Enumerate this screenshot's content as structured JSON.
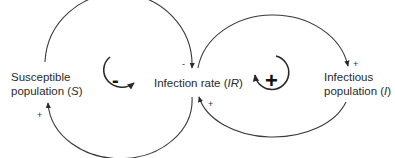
{
  "nodes": {
    "susceptible": {
      "line1": "Susceptible",
      "line2_prefix": "population (",
      "line2_var": "S",
      "line2_suffix": ")"
    },
    "infection_rate": {
      "prefix": "Infection rate (",
      "var": "IR",
      "suffix": ")"
    },
    "infectious": {
      "line1": "Infectious",
      "line2_prefix": "population (",
      "line2_var": "I",
      "line2_suffix": ")"
    }
  },
  "links": {
    "s_to_ir_polarity": "-",
    "ir_to_s_polarity": "+",
    "ir_to_i_polarity": "+",
    "i_to_ir_polarity": "+"
  },
  "loops": {
    "left": {
      "polarity": "-",
      "type": "balancing"
    },
    "right": {
      "polarity": "+",
      "type": "reinforcing"
    }
  },
  "colors": {
    "line": "#3a3a3a",
    "text": "#2a2a2a"
  }
}
